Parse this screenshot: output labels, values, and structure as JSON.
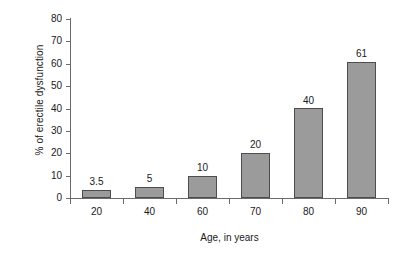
{
  "chart_data": {
    "type": "bar",
    "title": "",
    "xlabel": "Age, in years",
    "ylabel": "% of erectile dysfunction",
    "categories": [
      "20",
      "40",
      "60",
      "70",
      "80",
      "90"
    ],
    "values": [
      3.5,
      5,
      10,
      20,
      40,
      61
    ],
    "value_labels": [
      "3.5",
      "5",
      "10",
      "20",
      "40",
      "61"
    ],
    "ylim": [
      0,
      80
    ],
    "ytick_labels": [
      "0",
      "10",
      "20",
      "30",
      "40",
      "50",
      "60",
      "70",
      "80"
    ],
    "ytick_values": [
      0,
      10,
      20,
      30,
      40,
      50,
      60,
      70,
      80
    ],
    "grid": false,
    "legend": false,
    "series": [
      {
        "name": "% of erectile dysfunction",
        "values": [
          3.5,
          5,
          10,
          20,
          40,
          61
        ]
      }
    ],
    "colors": {
      "bar_fill": "#9b9b9b",
      "bar_border": "#4d4d4d",
      "axis": "#6b6b6b",
      "text": "#1a1a1a",
      "background": "#ffffff"
    }
  }
}
